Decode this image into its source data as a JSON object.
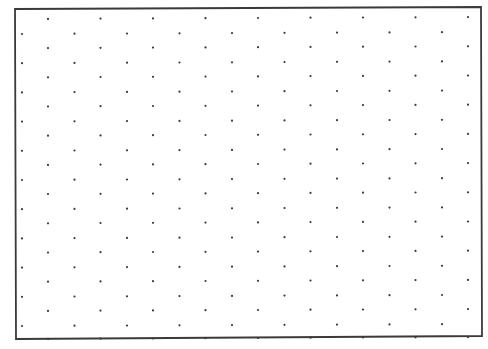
{
  "sheet": {
    "type": "isometric-dot-grid",
    "background_color": "#ffffff",
    "ink_color": "#3a3a3a",
    "frame": {
      "top_left": [
        15,
        9
      ],
      "top_right": [
        481,
        7
      ],
      "bottom_right": [
        482,
        336
      ],
      "bottom_left": [
        16,
        339
      ],
      "stroke_width": 1.8
    },
    "grid": {
      "main_columns": 9,
      "main_col_start_x": 48,
      "offset_col_start_x": 22,
      "col_spacing": 52.5,
      "rows_per_set": 11,
      "main_row_start_y": 19,
      "offset_row_start_y": 34,
      "row_spacing": 29.2,
      "dot_radius": 1.1,
      "bottom_tick_y": 338
    }
  }
}
